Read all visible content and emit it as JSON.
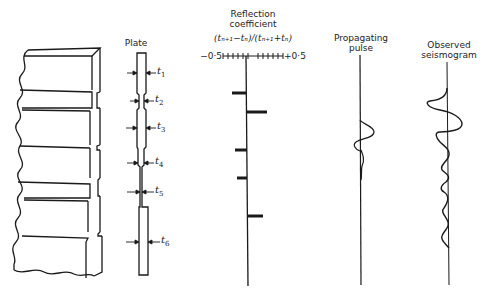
{
  "plate": {
    "title": "Plate",
    "thickness_labels": [
      {
        "symbol": "t",
        "sub": "1"
      },
      {
        "symbol": "t",
        "sub": "2"
      },
      {
        "symbol": "t",
        "sub": "3"
      },
      {
        "symbol": "t",
        "sub": "4"
      },
      {
        "symbol": "t",
        "sub": "5"
      },
      {
        "symbol": "t",
        "sub": "6"
      }
    ]
  },
  "reflection": {
    "title_line1": "Reflection",
    "title_line2": "coefficient",
    "formula": "(tₙ₊₁−tₙ)/(tₙ₊₁+tₙ)",
    "axis_min": "−0·5",
    "axis_max": "+0·5",
    "coefficients": [
      -0.25,
      0.35,
      -0.2,
      -0.15,
      0.25
    ]
  },
  "pulse": {
    "title_line1": "Propagating",
    "title_line2": "pulse"
  },
  "seismogram": {
    "title_line1": "Observed",
    "title_line2": "seismogram"
  },
  "colors": {
    "ink": "#1a1a1a",
    "background": "#ffffff"
  }
}
